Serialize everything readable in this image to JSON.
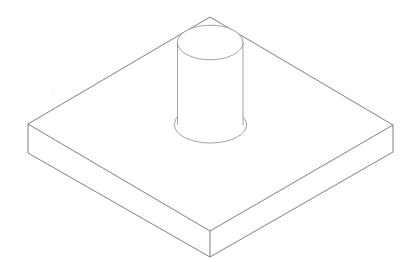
{
  "drawing": {
    "title": "Isometric view: square base plate with cylindrical post",
    "style": "wireframe line drawing",
    "background": "#ffffff",
    "line_color": "#707070"
  },
  "parts": [
    {
      "name": "base-plate",
      "shape": "rectangular slab",
      "view": "isometric"
    },
    {
      "name": "cylinder-post",
      "shape": "cylinder",
      "view": "isometric"
    }
  ]
}
